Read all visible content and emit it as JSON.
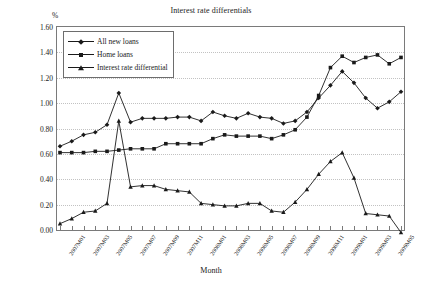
{
  "chart": {
    "title": "Interest rate differentials",
    "y_unit": "%",
    "xlabel": "Month"
  },
  "legend": {
    "items": [
      {
        "label": "All new loans",
        "marker": "diamond"
      },
      {
        "label": "Home loans",
        "marker": "square"
      },
      {
        "label": "Interest rate differential",
        "marker": "triangle"
      }
    ]
  },
  "chart_data": {
    "type": "line",
    "title": "Interest rate differentials",
    "xlabel": "Month",
    "ylabel": "%",
    "ylim": [
      0.0,
      1.6
    ],
    "ytick_step": 0.2,
    "grid": true,
    "legend_position": "top-left",
    "ytick_labels": [
      "0.00",
      "0.20",
      "0.40",
      "0.60",
      "0.80",
      "1.00",
      "1.20",
      "1.40",
      "1.60"
    ],
    "x": [
      "2007M01",
      "2007M02",
      "2007M03",
      "2007M04",
      "2007M05",
      "2007M06",
      "2007M07",
      "2007M08",
      "2007M09",
      "2007M10",
      "2007M11",
      "2007M12",
      "2008M01",
      "2008M02",
      "2008M03",
      "2008M04",
      "2008M05",
      "2008M06",
      "2008M07",
      "2008M08",
      "2008M09",
      "2008M10",
      "2008M11",
      "2008M12",
      "2009M01",
      "2009M02",
      "2009M03",
      "2009M04",
      "2009M05",
      "2009M06"
    ],
    "xtick_labels": [
      "2007M01",
      "2007M03",
      "2007M05",
      "2007M07",
      "2007M09",
      "2007M11",
      "2008M01",
      "2008M03",
      "2008M05",
      "2008M07",
      "2008M09",
      "2008M11",
      "2009M01",
      "2009M03",
      "2009M05"
    ],
    "series": [
      {
        "name": "All new loans",
        "marker": "diamond",
        "values": [
          0.66,
          0.7,
          0.75,
          0.77,
          0.83,
          1.08,
          0.85,
          0.88,
          0.88,
          0.88,
          0.89,
          0.89,
          0.86,
          0.93,
          0.9,
          0.88,
          0.92,
          0.89,
          0.88,
          0.84,
          0.86,
          0.93,
          1.04,
          1.14,
          1.25,
          1.16,
          1.04,
          0.96,
          1.01,
          1.09
        ]
      },
      {
        "name": "Home loans",
        "marker": "square",
        "values": [
          0.61,
          0.61,
          0.61,
          0.62,
          0.62,
          0.63,
          0.64,
          0.64,
          0.64,
          0.68,
          0.68,
          0.68,
          0.68,
          0.72,
          0.75,
          0.74,
          0.74,
          0.74,
          0.72,
          0.75,
          0.79,
          0.89,
          1.06,
          1.28,
          1.37,
          1.32,
          1.36,
          1.38,
          1.31,
          1.36
        ]
      },
      {
        "name": "Interest rate differential",
        "marker": "triangle",
        "values": [
          0.05,
          0.09,
          0.14,
          0.15,
          0.21,
          0.86,
          0.34,
          0.35,
          0.35,
          0.32,
          0.31,
          0.3,
          0.21,
          0.2,
          0.19,
          0.19,
          0.21,
          0.21,
          0.15,
          0.14,
          0.22,
          0.32,
          0.44,
          0.54,
          0.61,
          0.41,
          0.13,
          0.12,
          0.11,
          -0.02
        ]
      }
    ]
  }
}
